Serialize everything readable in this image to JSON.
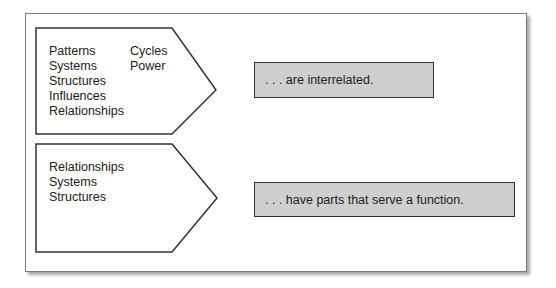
{
  "diagram": {
    "rows": [
      {
        "terms_col1": [
          "Patterns",
          "Systems",
          "Structures",
          "Influences",
          "Relationships"
        ],
        "terms_col2": [
          "Cycles",
          "Power"
        ],
        "result": ". . . are interrelated."
      },
      {
        "terms_col1": [
          "Relationships",
          "Systems",
          "Structures"
        ],
        "terms_col2": [],
        "result": ". . . have parts that serve a function."
      }
    ],
    "colors": {
      "border": "#333333",
      "result_fill": "#cfcfcf",
      "frame_border": "#7a7a7a"
    }
  }
}
